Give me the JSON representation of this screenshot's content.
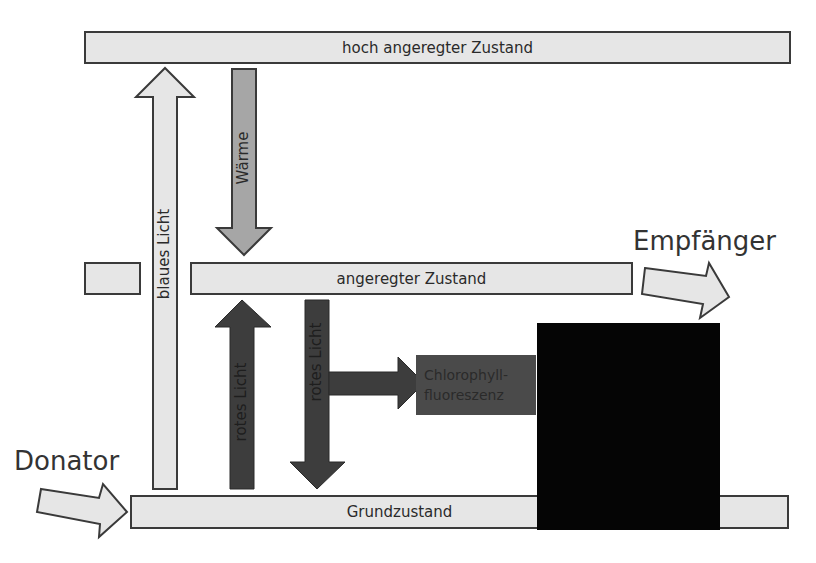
{
  "levels": {
    "high": "hoch angeregter Zustand",
    "excited": "angeregter Zustand",
    "ground": "Grundzustand"
  },
  "arrows": {
    "blue_light": "blaues Licht",
    "heat": "Wärme",
    "red_light_up": "rotes Licht",
    "red_light_down": "rotes Licht"
  },
  "fluorescence": {
    "line1": "Chlorophyll-",
    "line2": "fluoreszenz"
  },
  "labels": {
    "acceptor": "Empfänger",
    "donor": "Donator"
  },
  "colors": {
    "level_fill": "#e6e6e6",
    "heat_fill": "#a6a6a6",
    "red_fill": "#3d3d3d",
    "outline": "#3a3a3a"
  }
}
